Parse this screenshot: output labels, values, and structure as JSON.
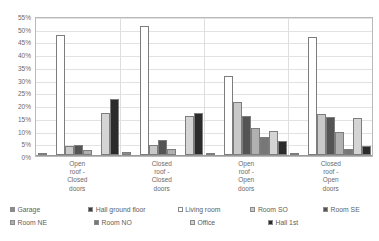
{
  "chart_data": {
    "type": "bar",
    "title": "",
    "xlabel": "",
    "ylabel": "",
    "ylim": [
      0,
      55
    ],
    "grid": true,
    "legend_position": "bottom",
    "y_ticks": [
      "55%",
      "50%",
      "45%",
      "40%",
      "35%",
      "30%",
      "25%",
      "20%",
      "15%",
      "10%",
      "5%",
      "0%"
    ],
    "y_tick_values": [
      55,
      50,
      45,
      40,
      35,
      30,
      25,
      20,
      15,
      10,
      5,
      0
    ],
    "categories": [
      "Open roof - Closed doors",
      "Closed roof - Closed doors",
      "Open roof - Open doors",
      "Closed roof - Open doors"
    ],
    "category_lines": [
      [
        "Open",
        "roof -",
        "Closed",
        "doors"
      ],
      [
        "Closed",
        "roof -",
        "Closed",
        "doors"
      ],
      [
        "Open",
        "roof -",
        "Open",
        "doors"
      ],
      [
        "Closed",
        "roof -",
        "Open",
        "doors"
      ]
    ],
    "series": [
      {
        "name": "Garage",
        "color": "#8c8c8c",
        "values": [
          0.6,
          1.0,
          0.6,
          0.6
        ]
      },
      {
        "name": "Hall ground floor",
        "color": "#3f3f3f",
        "values": [
          0.0,
          0.0,
          0.0,
          0.0
        ]
      },
      {
        "name": "Living room",
        "color": "#ffffff",
        "values": [
          47.0,
          50.5,
          31.0,
          46.5
        ]
      },
      {
        "name": "Room SO",
        "color": "#c9c9c9",
        "values": [
          3.5,
          4.0,
          21.0,
          16.0
        ]
      },
      {
        "name": "Room SE",
        "color": "#545454",
        "values": [
          4.0,
          6.0,
          15.5,
          15.0
        ]
      },
      {
        "name": "Room NE",
        "color": "#b0b0b0",
        "values": [
          2.0,
          2.5,
          10.5,
          9.0
        ]
      },
      {
        "name": "Room NO",
        "color": "#777777",
        "values": [
          0.0,
          0.0,
          7.0,
          2.5
        ]
      },
      {
        "name": "Office",
        "color": "#d4d4d4",
        "values": [
          16.5,
          15.5,
          9.5,
          14.5
        ]
      },
      {
        "name": "Hall 1st",
        "color": "#2b2b2b",
        "values": [
          22.0,
          16.5,
          5.5,
          3.5
        ]
      }
    ]
  },
  "legend": {
    "rows": [
      [
        {
          "label": "Garage",
          "color": "#8c8c8c",
          "width": 84
        },
        {
          "label": "Hall ground floor",
          "color": "#3f3f3f",
          "width": 96
        },
        {
          "label": "Living room",
          "color": "#ffffff",
          "width": 78
        },
        {
          "label": "Room SO",
          "color": "#c9c9c9",
          "width": 78
        },
        {
          "label": "Room SE",
          "color": "#545454",
          "width": 60
        }
      ],
      [
        {
          "label": "Room NE",
          "color": "#b0b0b0",
          "width": 84
        },
        {
          "label": "Room NO",
          "color": "#777777",
          "width": 96
        },
        {
          "label": "Office",
          "color": "#d4d4d4",
          "width": 78
        },
        {
          "label": "Hall 1st",
          "color": "#2b2b2b",
          "width": 78
        }
      ]
    ]
  }
}
